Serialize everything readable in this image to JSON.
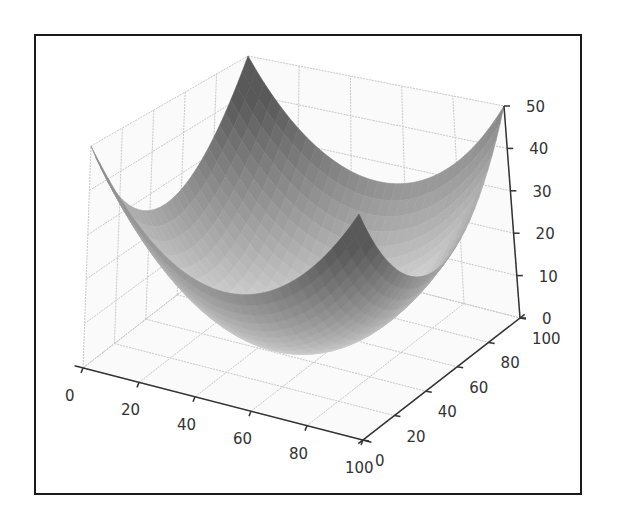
{
  "chart_data": {
    "type": "surface3d",
    "title": "",
    "function": "z = ((x - 50)^2 + (y - 50)^2) / 100",
    "colormap": "grayscale",
    "x": {
      "label": "",
      "range": [
        0,
        100
      ],
      "ticks": [
        0,
        20,
        40,
        60,
        80,
        100
      ]
    },
    "y": {
      "label": "",
      "range": [
        0,
        100
      ],
      "ticks": [
        0,
        20,
        40,
        60,
        80,
        100
      ]
    },
    "z": {
      "label": "",
      "range": [
        0,
        50
      ],
      "ticks": [
        0,
        10,
        20,
        30,
        40,
        50
      ]
    },
    "grid": true,
    "legend": null,
    "corner_values": [
      {
        "x": 0,
        "y": 0,
        "z": 50
      },
      {
        "x": 100,
        "y": 0,
        "z": 50
      },
      {
        "x": 0,
        "y": 100,
        "z": 50
      },
      {
        "x": 100,
        "y": 100,
        "z": 50
      }
    ],
    "minimum": {
      "x": 50,
      "y": 50,
      "z": 0
    }
  },
  "axes": {
    "x_tick_labels": [
      "0",
      "20",
      "40",
      "60",
      "80",
      "100"
    ],
    "y_tick_labels": [
      "0",
      "20",
      "40",
      "60",
      "80",
      "100"
    ],
    "z_tick_labels": [
      "0",
      "10",
      "20",
      "30",
      "40",
      "50"
    ]
  },
  "style": {
    "frame_color": "#1a1a1a",
    "axis_color": "#333333",
    "grid_color": "#c8c8c8",
    "pane_color": "#fafafa",
    "surface_dark": "#6e6e6e",
    "surface_light": "#ececec"
  }
}
